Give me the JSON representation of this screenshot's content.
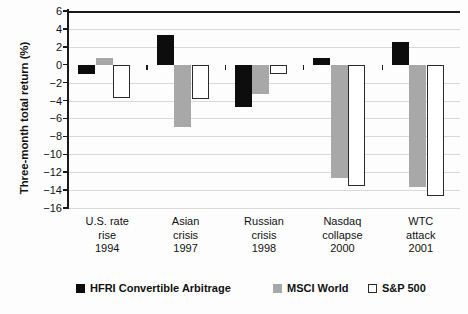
{
  "chart_data": {
    "type": "bar",
    "title": "",
    "xlabel": "",
    "ylabel": "Three-month total return (%)",
    "ylim": [
      -16,
      6
    ],
    "yticks": [
      6,
      4,
      2,
      0,
      -2,
      -4,
      -6,
      -8,
      -10,
      -12,
      -14,
      -16
    ],
    "ytick_labels": [
      "6",
      "4",
      "2",
      "0",
      "−2",
      "−4",
      "−6",
      "−8",
      "−10",
      "−12",
      "−14",
      "−16"
    ],
    "grid": true,
    "legend_position": "bottom",
    "categories": [
      {
        "lines": [
          "U.S. rate",
          "rise",
          "1994"
        ]
      },
      {
        "lines": [
          "Asian",
          "crisis",
          "1997"
        ]
      },
      {
        "lines": [
          "Russian",
          "crisis",
          "1998"
        ]
      },
      {
        "lines": [
          "Nasdaq",
          "collapse",
          "2000"
        ]
      },
      {
        "lines": [
          "WTC",
          "attack",
          "2001"
        ]
      }
    ],
    "series": [
      {
        "name": "HFRI Convertible Arbitrage",
        "color": "#0d0d0d",
        "style": "solid",
        "values": [
          -1.0,
          3.3,
          -4.7,
          0.8,
          2.5
        ]
      },
      {
        "name": "MSCI World",
        "color": "#a8a8a8",
        "style": "solid",
        "values": [
          0.7,
          -6.9,
          -3.3,
          -12.6,
          -13.6
        ]
      },
      {
        "name": "S&P 500",
        "color": "#ffffff",
        "style": "outline",
        "values": [
          -3.7,
          -3.8,
          -1.0,
          -13.5,
          -14.7
        ]
      }
    ]
  }
}
